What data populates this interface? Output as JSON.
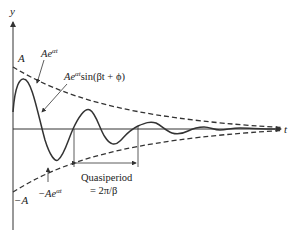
{
  "diagram": {
    "type": "damped-oscillation",
    "axes": {
      "y_label": "y",
      "t_label": "t"
    },
    "labels": {
      "A": "A",
      "neg_A": "−A",
      "upper_envelope": "Ae",
      "upper_envelope_exp": "αt",
      "lower_envelope_prefix": "−Ae",
      "lower_envelope_exp": "αt",
      "curve_prefix": "Ae",
      "curve_exp": "αt",
      "curve_suffix": "sin(βt + ϕ)",
      "quasiperiod": "Quasiperiod",
      "quasiperiod_value": "= 2π/β"
    },
    "colors": {
      "stroke": "#333333",
      "background": "#ffffff"
    }
  }
}
